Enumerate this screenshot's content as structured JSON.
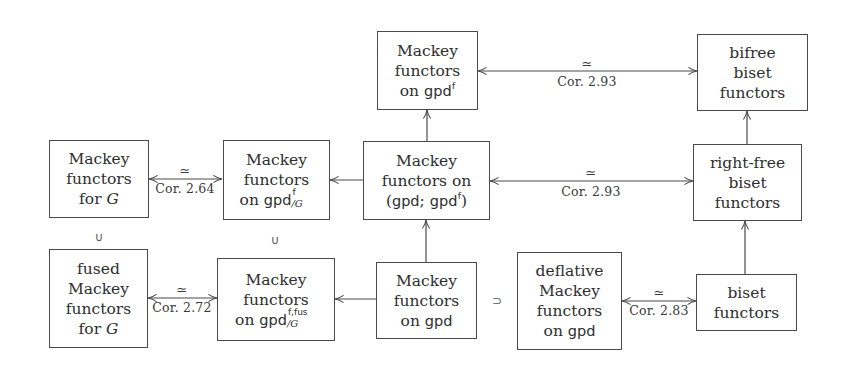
{
  "diagram": {
    "nodes": {
      "mackey_for_G": {
        "lines": [
          "Mackey",
          "functors",
          "for"
        ],
        "math": "G"
      },
      "mackey_on_gpd_f_G": {
        "lines": [
          "Mackey",
          "functors",
          "on"
        ],
        "math": "gpd",
        "sup": "f",
        "sub": "/G"
      },
      "mackey_on_gpd_gpd_f": {
        "lines": [
          "Mackey",
          "functors on",
          "("
        ],
        "math1": "gpd",
        "sep": "; ",
        "math2": "gpd",
        "sup": "f",
        "close": ")"
      },
      "mackey_on_gpd_f": {
        "lines": [
          "Mackey",
          "functors",
          "on"
        ],
        "math": "gpd",
        "sup": "f"
      },
      "bifree_biset": {
        "lines": [
          "bifree",
          "biset",
          "functors"
        ]
      },
      "right_free_biset": {
        "lines": [
          "right-free",
          "biset",
          "functors"
        ]
      },
      "fused_mackey_for_G": {
        "lines": [
          "fused",
          "Mackey",
          "functors",
          "for"
        ],
        "math": "G"
      },
      "mackey_on_gpd_f_fus_G": {
        "lines": [
          "Mackey",
          "functors",
          "on"
        ],
        "math": "gpd",
        "sup": "f,fus",
        "sub": "/G"
      },
      "mackey_on_gpd": {
        "lines": [
          "Mackey",
          "functors",
          "on"
        ],
        "math": "gpd"
      },
      "deflative_mackey_on_gpd": {
        "lines": [
          "deflative",
          "Mackey",
          "functors",
          "on"
        ],
        "math": "gpd"
      },
      "biset_functors": {
        "lines": [
          "biset",
          "functors"
        ]
      }
    },
    "edges": [
      {
        "from": "mackey_on_gpd_f",
        "to": "bifree_biset",
        "type": "bidirectional",
        "iso": "≃",
        "label": "Cor. 2.93"
      },
      {
        "from": "mackey_for_G",
        "to": "mackey_on_gpd_f_G",
        "type": "bidirectional",
        "iso": "≃",
        "label": "Cor. 2.64"
      },
      {
        "from": "mackey_on_gpd_gpd_f",
        "to": "mackey_on_gpd_f_G",
        "type": "arrow"
      },
      {
        "from": "mackey_on_gpd_gpd_f",
        "to": "right_free_biset",
        "type": "bidirectional",
        "iso": "≃",
        "label": "Cor. 2.93"
      },
      {
        "from": "mackey_on_gpd_gpd_f",
        "to": "mackey_on_gpd_f",
        "type": "arrow"
      },
      {
        "from": "right_free_biset",
        "to": "bifree_biset",
        "type": "arrow"
      },
      {
        "from": "fused_mackey_for_G",
        "to": "mackey_on_gpd_f_fus_G",
        "type": "bidirectional",
        "iso": "≃",
        "label": "Cor. 2.72"
      },
      {
        "from": "mackey_on_gpd",
        "to": "mackey_on_gpd_f_fus_G",
        "type": "arrow"
      },
      {
        "from": "mackey_on_gpd",
        "to": "mackey_on_gpd_gpd_f",
        "type": "arrow"
      },
      {
        "from": "deflative_mackey_on_gpd",
        "to": "biset_functors",
        "type": "bidirectional",
        "iso": "≃",
        "label": "Cor. 2.83"
      },
      {
        "from": "biset_functors",
        "to": "right_free_biset",
        "type": "arrow"
      }
    ],
    "relations": [
      {
        "symbol": "∪",
        "between": [
          "mackey_for_G",
          "fused_mackey_for_G"
        ]
      },
      {
        "symbol": "∪",
        "between": [
          "mackey_on_gpd_f_G",
          "mackey_on_gpd_f_fus_G"
        ]
      },
      {
        "symbol": "⊃",
        "between": [
          "mackey_on_gpd",
          "deflative_mackey_on_gpd"
        ]
      }
    ]
  }
}
